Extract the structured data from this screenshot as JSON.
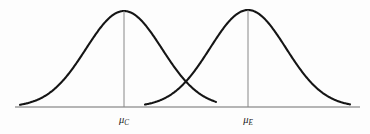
{
  "figure": {
    "background_color": "#fdfdfd",
    "curve_color": "#151515",
    "axis_color": "#6f6f6f",
    "mean_rule_color": "#888888",
    "label_color": "#1a1a1a"
  },
  "axis": {
    "x_start": 15,
    "x_end": 360,
    "y": 107,
    "visible": true
  },
  "labels": {
    "control_mean": {
      "symbol": "μ",
      "subscript": "C",
      "full": "μC",
      "x": 124,
      "y": 123
    },
    "experimental_mean": {
      "symbol": "μ",
      "subscript": "E",
      "full": "μE",
      "x": 248,
      "y": 123
    }
  },
  "chart_data": {
    "type": "line",
    "subtitle": "",
    "xlabel": "",
    "ylabel": "",
    "grid": false,
    "legend_position": "none",
    "annotations": [
      {
        "text": "μC",
        "x": 124,
        "y": 123,
        "meaning": "mean of control group"
      },
      {
        "text": "μE",
        "x": 248,
        "y": 123,
        "meaning": "mean of experimental group"
      }
    ],
    "axis_ranges": {
      "xlim": [
        15,
        360
      ],
      "ylim": [
        0,
        1
      ]
    },
    "series": [
      {
        "name": "Control distribution",
        "distribution": "normal",
        "mean_px": 124,
        "sigma_px": 38,
        "peak_px": {
          "x": 124,
          "y": 11
        },
        "tail_start_px": 20,
        "tail_end_px": 216,
        "baseline_px": 107,
        "color": "#151515",
        "mean_rule": true
      },
      {
        "name": "Experimental distribution",
        "distribution": "normal",
        "mean_px": 248,
        "sigma_px": 38,
        "peak_px": {
          "x": 248,
          "y": 10
        },
        "tail_start_px": 145,
        "tail_end_px": 350,
        "baseline_px": 107,
        "color": "#151515",
        "mean_rule": true
      }
    ],
    "crossing_point_px": {
      "x": 186,
      "y": 92
    }
  }
}
